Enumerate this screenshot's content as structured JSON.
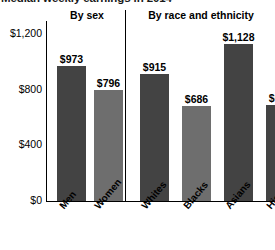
{
  "chart_data": {
    "type": "bar",
    "title": "Median weekly earnings in 2014",
    "xlabel": "",
    "ylabel": "",
    "ylim": [
      0,
      1200
    ],
    "ytick_labels": [
      "$1,200",
      "$800",
      "$400",
      "$0"
    ],
    "ytick_values": [
      1200,
      800,
      400,
      0
    ],
    "grid": false,
    "legend": "none",
    "panels": [
      {
        "header": "By sex",
        "categories": [
          "Men",
          "Women"
        ],
        "values": [
          973,
          796
        ],
        "value_labels": [
          "$973",
          "$796"
        ],
        "colors": [
          "#434343",
          "#6e6e6e"
        ]
      },
      {
        "header": "By race and ethnicity",
        "categories": [
          "Whites",
          "Blacks",
          "Asians",
          "Hispanics"
        ],
        "values": [
          915,
          686,
          1128,
          689
        ],
        "value_labels": [
          "$915",
          "$686",
          "$1,128",
          "$689"
        ],
        "colors": [
          "#434343",
          "#6e6e6e",
          "#434343",
          "#434343"
        ]
      }
    ]
  }
}
